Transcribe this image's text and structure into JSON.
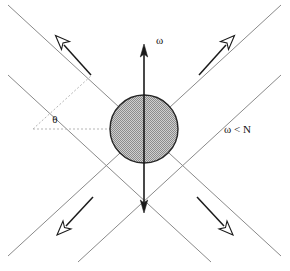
{
  "figure": {
    "background_color": "#ffffff",
    "width": 290,
    "height": 271,
    "labels": {
      "omega_axis": "ω",
      "theta_angle": "θ",
      "frequency_condition": "ω < N"
    },
    "colors": {
      "cone_line": "#8a8a8a",
      "dashed_line": "#b5b5b5",
      "arrow_stroke": "#1a1a1a",
      "arrow_head_fill": "#ffffff",
      "circle_outline": "#262626",
      "circle_fill": "#9e9e9e",
      "text": "#111111"
    },
    "source_region": {
      "name": "stippled-source-circle",
      "center_x": 144,
      "center_y": 129,
      "radius": 34,
      "fill_pattern": "stipple"
    },
    "vertical_axis": {
      "name": "omega-axis",
      "x": 144,
      "top_y": 45,
      "bottom_y": 212,
      "arrowheads": [
        "up",
        "down"
      ]
    },
    "cone_lines": [
      {
        "name": "cone-line-main-down-right",
        "x1": 8,
        "y1": 5,
        "x2": 281,
        "y2": 256
      },
      {
        "name": "cone-line-main-up-right",
        "x1": 8,
        "y1": 256,
        "x2": 281,
        "y2": 5
      },
      {
        "name": "cone-line-offset-down-right",
        "x1": 8,
        "y1": 75,
        "x2": 211,
        "y2": 262
      },
      {
        "name": "cone-line-offset-up-right",
        "x1": 78,
        "y1": 262,
        "x2": 281,
        "y2": 75
      }
    ],
    "dashed_lines": [
      {
        "name": "dashed-horizontal-reference",
        "x1": 33,
        "y1": 129,
        "x2": 140,
        "y2": 129
      },
      {
        "name": "dashed-angle-ray",
        "x1": 33,
        "y1": 129,
        "x2": 90,
        "y2": 77
      }
    ],
    "group_velocity_arrows": [
      {
        "name": "group-velocity-arrow-upper-left",
        "x1": 90,
        "y1": 74,
        "x2": 56,
        "y2": 36,
        "direction": "up-left"
      },
      {
        "name": "group-velocity-arrow-upper-right",
        "x1": 200,
        "y1": 74,
        "x2": 235,
        "y2": 36,
        "direction": "up-right"
      },
      {
        "name": "group-velocity-arrow-lower-left",
        "x1": 93,
        "y1": 198,
        "x2": 57,
        "y2": 234,
        "direction": "down-left"
      },
      {
        "name": "group-velocity-arrow-lower-right",
        "x1": 198,
        "y1": 198,
        "x2": 234,
        "y2": 234,
        "direction": "down-right"
      }
    ],
    "label_positions": {
      "omega_axis": {
        "x": 156,
        "y": 44
      },
      "theta_angle": {
        "x": 55,
        "y": 123
      },
      "frequency_condition": {
        "x": 224,
        "y": 133
      }
    }
  }
}
